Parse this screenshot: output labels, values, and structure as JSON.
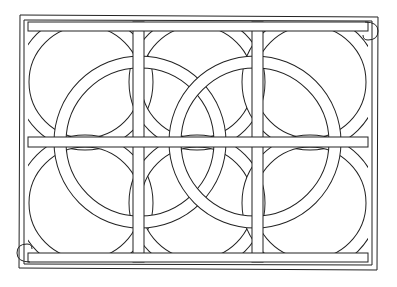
{
  "artwork": {
    "type": "line-art coloring page",
    "subject": "celtic-knot-circle-pattern",
    "grid": {
      "columns": 3,
      "rows": 2
    },
    "colors": {
      "background": "#ffffff",
      "line": "#222222"
    }
  }
}
